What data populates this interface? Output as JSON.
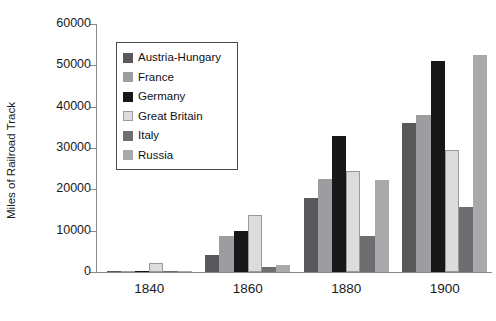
{
  "chart_data": {
    "type": "bar",
    "title": "",
    "subtitle": "",
    "xlabel": "",
    "ylabel": "Miles of Railroad Track",
    "categories": [
      "1840",
      "1860",
      "1880",
      "1900"
    ],
    "ylim": [
      0,
      60000
    ],
    "ytick_labels": [
      "0",
      "10000",
      "20000",
      "30000",
      "40000",
      "50000",
      "60000"
    ],
    "ytick_values": [
      0,
      10000,
      20000,
      30000,
      40000,
      50000,
      60000
    ],
    "grid": false,
    "legend_position": "upper-left-inside",
    "series": [
      {
        "name": "Austria-Hungary",
        "color": "#59595b",
        "values": [
          100,
          4000,
          18000,
          36000
        ]
      },
      {
        "name": "France",
        "color": "#9d9d9f",
        "values": [
          300,
          8800,
          22400,
          38000
        ]
      },
      {
        "name": "Germany",
        "color": "#17171a",
        "values": [
          300,
          10000,
          33000,
          51000
        ]
      },
      {
        "name": "Great Britain",
        "color": "#dcdcdc",
        "values": [
          2200,
          13800,
          24500,
          29500
        ]
      },
      {
        "name": "Italy",
        "color": "#6e6e70",
        "values": [
          100,
          1100,
          8800,
          15700
        ]
      },
      {
        "name": "Russia",
        "color": "#a9a9ab",
        "values": [
          200,
          1600,
          22200,
          52500
        ]
      }
    ]
  }
}
